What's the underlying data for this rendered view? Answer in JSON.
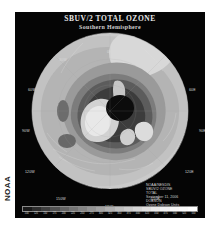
{
  "page": {
    "margin_label": "NOAA",
    "panel_bg": "#050505",
    "page_bg": "#ffffff"
  },
  "title": {
    "main": "SBUV/2 TOTAL OZONE",
    "sub": "Southern Hemisphere"
  },
  "map": {
    "projection": "polar-stereographic",
    "hemisphere": "Southern",
    "pole_marker": "+",
    "longitude_labels": [
      {
        "label": "0E",
        "x": 84,
        "y": 21
      },
      {
        "label": "30E",
        "x": 131,
        "y": 29
      },
      {
        "label": "60E",
        "x": 166,
        "y": 59
      },
      {
        "label": "90E",
        "x": 178,
        "y": 102
      },
      {
        "label": "120E",
        "x": 165,
        "y": 145
      },
      {
        "label": "150E",
        "x": 131,
        "y": 175
      },
      {
        "label": "180E",
        "x": 84,
        "y": 184
      },
      {
        "label": "150W",
        "x": 33,
        "y": 175
      },
      {
        "label": "120W",
        "x": 3,
        "y": 145
      },
      {
        "label": "90W",
        "x": -3,
        "y": 102
      },
      {
        "label": "60W",
        "x": 4,
        "y": 59
      },
      {
        "label": "30W",
        "x": 35,
        "y": 29
      }
    ]
  },
  "credit": {
    "lines": [
      "NOAA/NESDIS",
      "SBUV/2 OZONE",
      "TOTAL",
      "September 11, 2006",
      "DOBSON",
      "Ozone Dobson Units"
    ]
  },
  "chart_data": {
    "type": "heatmap",
    "title": "SBUV/2 TOTAL OZONE",
    "subtitle": "Southern Hemisphere",
    "xlabel": "",
    "ylabel": "",
    "units": "Dobson Units",
    "grid": true,
    "legend_position": "bottom",
    "colorbar": {
      "orientation": "horizontal",
      "tick_labels": [
        "100",
        "125",
        "150",
        "175",
        "200",
        "225",
        "250",
        "275",
        "300",
        "325",
        "350",
        "375",
        "400",
        "425",
        "450",
        "475",
        "500",
        "525",
        "550"
      ],
      "colors": [
        "#1a1a1a",
        "#2e2e2e",
        "#404040",
        "#525252",
        "#636363",
        "#747474",
        "#848484",
        "#949494",
        "#a3a3a3",
        "#b1b1b1",
        "#bfbfbf",
        "#cbcbcb",
        "#d6d6d6",
        "#e0e0e0",
        "#e9e9e9",
        "#f0f0f0",
        "#f6f6f6",
        "#fafafa",
        "#ffffff"
      ],
      "vmin": 100,
      "vmax": 550
    },
    "contour_bands": [
      {
        "name": "ozone-hole-core",
        "value": 110,
        "color": "#0c0c0c"
      },
      {
        "name": "band-150",
        "value": 150,
        "color": "#3a3a3a"
      },
      {
        "name": "band-200",
        "value": 200,
        "color": "#5a5a5a"
      },
      {
        "name": "band-250",
        "value": 250,
        "color": "#787878"
      },
      {
        "name": "band-300",
        "value": 300,
        "color": "#9a9a9a"
      },
      {
        "name": "band-350",
        "value": 350,
        "color": "#b4b4b4"
      },
      {
        "name": "band-400",
        "value": 400,
        "color": "#cacaca"
      },
      {
        "name": "band-450",
        "value": 450,
        "color": "#dedede"
      }
    ]
  }
}
